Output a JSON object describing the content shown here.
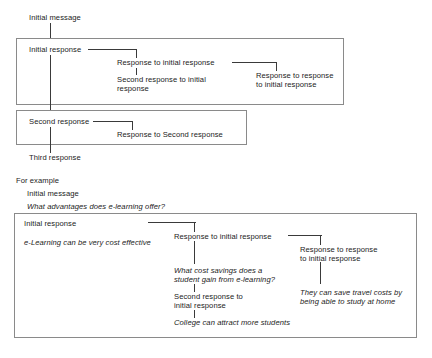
{
  "diagram": {
    "line_color": "#3a3a3a",
    "box_color": "#8a8a8a",
    "text_color": "#1b1b1b"
  },
  "schematic": {
    "initial_message": "Initial message",
    "initial_response": "Initial response",
    "response_to_initial_response": "Response to initial response",
    "second_response_to_initial_line1": "Second response to initial",
    "second_response_to_initial_line2": "response",
    "response_to_response_line1": "Response to response",
    "response_to_response_line2": "to initial response",
    "second_response": "Second response",
    "response_to_second_response": "Response to Second response",
    "third_response": "Third response"
  },
  "example": {
    "heading": "For example",
    "initial_message": "Initial message",
    "initial_message_text": "What advantages does e-learning offer?",
    "initial_response": "Initial response",
    "initial_response_text": "e-Learning can be very cost effective",
    "response_to_initial_response": "Response to initial response",
    "response_to_initial_text_line1": "What cost savings does a",
    "response_to_initial_text_line2": "student gain from e-learning?",
    "second_response_line1": "Second response to",
    "second_response_line2": "initial response",
    "second_response_text": "College can attract more students",
    "response_to_response_line1": "Response to response",
    "response_to_response_line2": "to initial response",
    "response_to_response_text_line1": "They can save travel costs by",
    "response_to_response_text_line2": "being able to study at home"
  }
}
